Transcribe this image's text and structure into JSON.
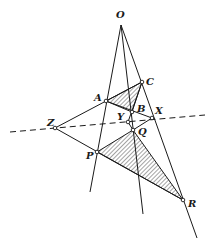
{
  "diagram": {
    "labels": {
      "O": "O",
      "A": "A",
      "B": "B",
      "C": "C",
      "P": "P",
      "Q": "Q",
      "R": "R",
      "X": "X",
      "Y": "Y",
      "Z": "Z"
    },
    "triangles": [
      {
        "name": "ABC",
        "vertices": [
          "A",
          "B",
          "C"
        ],
        "shaded": true
      },
      {
        "name": "PQR",
        "vertices": [
          "P",
          "Q",
          "R"
        ],
        "shaded": true
      }
    ],
    "concurrent_lines_through": "O",
    "collinear_dashed_line": [
      "Z",
      "Y",
      "X"
    ],
    "colors": {
      "stroke": "#1a1a1a",
      "background": "#ffffff"
    }
  }
}
